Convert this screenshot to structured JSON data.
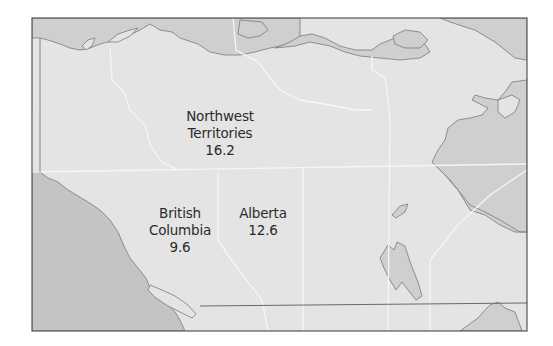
{
  "map": {
    "colors": {
      "land": "#e4e4e4",
      "water": "#c9c9c9",
      "coast": "#7a7a7a",
      "border": "#f6f6f6",
      "frame": "#555555",
      "text": "#2b2b2b"
    },
    "regions": [
      {
        "name": "Northwest Territories",
        "line1": "Northwest",
        "line2": "Territories",
        "value": "16.2"
      },
      {
        "name": "British Columbia",
        "line1": "British",
        "line2": "Columbia",
        "value": "9.6"
      },
      {
        "name": "Alberta",
        "line1": "Alberta",
        "value": "12.6"
      }
    ]
  }
}
